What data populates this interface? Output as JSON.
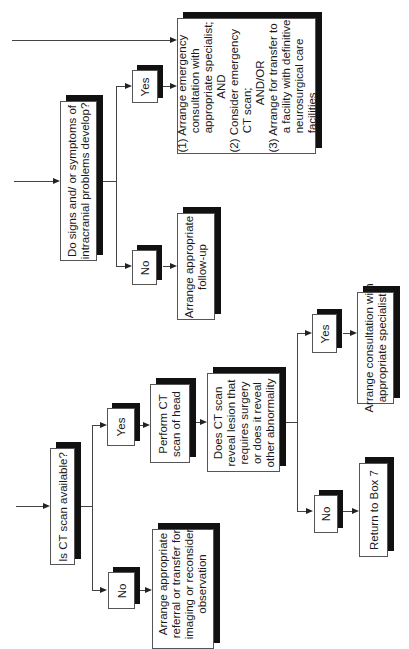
{
  "flowchart": {
    "orientation": "rotated 90 degrees counter-clockwise",
    "q_signs": "Do signs and/ or symptoms of\nintracranial problems develop?",
    "q_signs_yes": "Yes",
    "q_signs_no": "No",
    "emergency_actions": "(1) Arrange emergency\n      consultation with\n      appropriate specialist;\n                 AND\n(2) Consider emergency\n      CT scan;\n               AND/OR\n(3) Arrange for transfer to\n      a facility with definitive\n      neurosurgical care\n      facilities",
    "follow_up": "Arrange appropriate\nfollow-up",
    "q_ct_available": "Is CT scan available?",
    "q_ct_yes": "Yes",
    "q_ct_no": "No",
    "perform_ct": "Perform CT\nscan of head",
    "referral": "Arrange appropriate\nreferral or transfer for\nimaging or reconsider\nobservation",
    "q_ct_reveal": "Does CT scan\nreveal lesion that\nrequires surgery\nor does it reveal\nother abnormality",
    "q_reveal_yes": "Yes",
    "q_reveal_no": "No",
    "consult_specialist": "Arrange consultation with\nappropriate specialist",
    "return_box7": "Return to Box 7"
  }
}
